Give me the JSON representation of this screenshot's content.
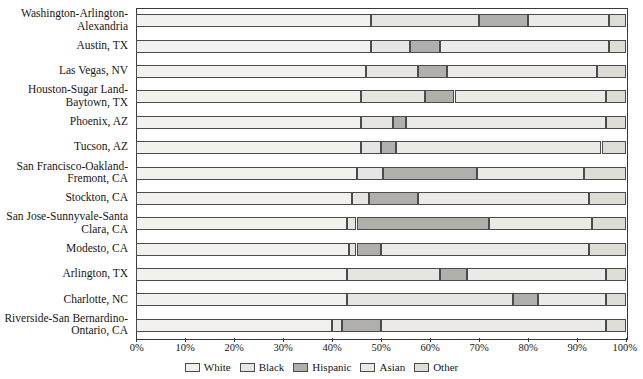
{
  "chart_data": {
    "type": "bar",
    "orientation": "horizontal",
    "stacked": true,
    "normalized": true,
    "title": "",
    "subtitle": "",
    "xlabel": "",
    "ylabel": "",
    "grid": false,
    "legend_position": "bottom",
    "xlim": [
      0,
      100
    ],
    "xticks": [
      0,
      10,
      20,
      30,
      40,
      50,
      60,
      70,
      80,
      90,
      100
    ],
    "xticklabels": [
      "0%",
      "10%",
      "20%",
      "30%",
      "40%",
      "50%",
      "60%",
      "70%",
      "80%",
      "90%",
      "100%"
    ],
    "series": [
      {
        "name": "White",
        "color": "#f2f1ee",
        "values": [
          48.0,
          48.0,
          47.0,
          46.0,
          46.0,
          46.0,
          45.0,
          44.0,
          43.0,
          43.5,
          43.0,
          43.0,
          40.0
        ]
      },
      {
        "name": "Black",
        "color": "#e6e5e1",
        "values": [
          22.0,
          8.0,
          10.5,
          13.0,
          6.5,
          4.0,
          5.5,
          3.5,
          2.0,
          1.5,
          19.0,
          34.0,
          2.0
        ]
      },
      {
        "name": "Hispanic",
        "color": "#b0afab",
        "values": [
          10.0,
          6.0,
          6.0,
          6.0,
          2.5,
          3.0,
          19.0,
          10.0,
          27.0,
          5.0,
          5.5,
          5.0,
          8.0
        ]
      },
      {
        "name": "Asian",
        "color": "#eceae6",
        "values": [
          16.5,
          34.5,
          30.5,
          31.0,
          41.0,
          42.0,
          22.0,
          35.0,
          21.0,
          42.5,
          28.5,
          14.0,
          46.0
        ]
      },
      {
        "name": "Other",
        "color": "#dedcd7",
        "values": [
          3.5,
          3.5,
          6.0,
          4.0,
          4.0,
          5.0,
          8.5,
          7.5,
          7.0,
          7.5,
          4.0,
          4.0,
          4.0
        ]
      }
    ],
    "categories": [
      "Washington-Arlington-Alexandria",
      "Austin, TX",
      "Las Vegas, NV",
      "Houston-Sugar Land-Baytown, TX",
      "Phoenix, AZ",
      "Tucson, AZ",
      "San Francisco-Oakland-Fremont, CA",
      "Stockton, CA",
      "San Jose-Sunnyvale-Santa Clara, CA",
      "Modesto, CA",
      "Arlington, TX",
      "Charlotte, NC",
      "Riverside-San Bernardino-Ontario, CA"
    ],
    "category_label_lines": [
      [
        "Washington-Arlington-",
        "Alexandria"
      ],
      [
        "Austin, TX"
      ],
      [
        "Las Vegas, NV"
      ],
      [
        "Houston-Sugar Land-",
        "Baytown, TX"
      ],
      [
        "Phoenix, AZ"
      ],
      [
        "Tucson, AZ"
      ],
      [
        "San Francisco-Oakland-",
        "Fremont, CA"
      ],
      [
        "Stockton, CA"
      ],
      [
        "San Jose-Sunnyvale-Santa",
        "Clara, CA"
      ],
      [
        "Modesto, CA"
      ],
      [
        "Arlington, TX"
      ],
      [
        "Charlotte, NC"
      ],
      [
        "Riverside-San Bernardino-",
        "Ontario, CA"
      ]
    ]
  },
  "legend": {
    "items": [
      {
        "label": "White",
        "color": "#f2f1ee"
      },
      {
        "label": "Black",
        "color": "#e6e5e1"
      },
      {
        "label": "Hispanic",
        "color": "#b0afab"
      },
      {
        "label": "Asian",
        "color": "#eceae6"
      },
      {
        "label": "Other",
        "color": "#dedcd7"
      }
    ]
  },
  "style": {
    "border_color": "#4b4b4b",
    "axis_color": "#3a3a3a",
    "text_color": "#161616",
    "background": "#ffffff"
  }
}
